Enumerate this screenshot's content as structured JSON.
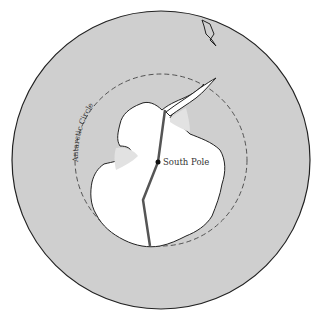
{
  "map": {
    "type": "polar projection",
    "colors": {
      "ocean": "#cfcfcf",
      "land": "#ffffff",
      "ice_shelf": "#e2e2e2",
      "outline": "#222222",
      "route": "#555555"
    },
    "labels": {
      "pole": "South Pole",
      "circle": "Antarctic Circle"
    }
  }
}
